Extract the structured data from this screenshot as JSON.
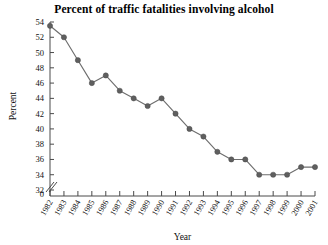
{
  "chart_data": {
    "type": "line",
    "title": "Percent of traffic fatalities involving alcohol",
    "xlabel": "Year",
    "ylabel": "Percent",
    "categories": [
      "1982",
      "1983",
      "1984",
      "1985",
      "1986",
      "1987",
      "1988",
      "1989",
      "1990",
      "1991",
      "1992",
      "1993",
      "1994",
      "1995",
      "1996",
      "1997",
      "1998",
      "1999",
      "2000",
      "2001"
    ],
    "values": [
      53.5,
      52,
      49,
      46,
      47,
      45,
      44,
      43,
      44,
      42,
      40,
      39,
      37,
      36,
      36,
      34,
      34,
      34,
      35,
      35
    ],
    "series": [
      {
        "name": "Percent of traffic fatalities involving alcohol",
        "values": [
          53.5,
          52,
          49,
          46,
          47,
          45,
          44,
          43,
          44,
          42,
          40,
          39,
          37,
          36,
          36,
          34,
          34,
          34,
          35,
          35
        ]
      }
    ],
    "ylim": [
      32,
      54
    ],
    "yticks": [
      54,
      52,
      50,
      48,
      46,
      44,
      42,
      40,
      38,
      36,
      34,
      32
    ],
    "y_axis_origin_label": "0",
    "y_axis_break": true,
    "grid": false,
    "legend": null,
    "marker": "circle",
    "marker_color": "#5f5f5f",
    "line_color": "#6e6e6e",
    "axis_color": "#4a4a4a",
    "background_color": "#ffffff"
  }
}
